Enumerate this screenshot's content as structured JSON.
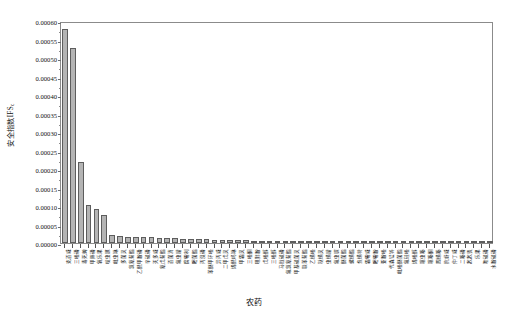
{
  "chart_data": {
    "type": "bar",
    "title": "",
    "subtitle": "",
    "xlabel": "农药",
    "ylabel": "安全指数IFS",
    "ylabel_sub": "c",
    "ylim": [
      0.0,
      0.0006
    ],
    "ytick_step": 5e-05,
    "grid": false,
    "legend": null,
    "bar_color": "#b4b4b4",
    "bar_edge_color": "#5d5d5d",
    "frame_color": "#8b8b8b",
    "ytick_labels": [
      "0.00000",
      "0.00005",
      "0.00010",
      "0.00015",
      "0.00020",
      "0.00025",
      "0.00030",
      "0.00035",
      "0.00040",
      "0.00045",
      "0.00050",
      "0.00055",
      "0.00060"
    ],
    "ytick_values": [
      0.0,
      5e-05,
      0.0001,
      0.00015,
      0.0002,
      0.00025,
      0.0003,
      0.00035,
      0.0004,
      0.00045,
      0.0005,
      0.00055,
      0.0006
    ],
    "categories": [
      "克百威",
      "三唑磷",
      "毒死蜱",
      "甲拌磷",
      "氧乐果",
      "啶虫脒",
      "吡虫啉",
      "多菌灵",
      "氯氰菊酯",
      "乙酰甲胺磷",
      "辛硫磷",
      "灭多威",
      "氰戊菊酯",
      "百菌清",
      "氟虫腈",
      "腐霉利",
      "嘧菌酯",
      "丙溴磷",
      "苯醚甲环唑",
      "异丙威",
      "二甲戊灵",
      "烯酰吗啉",
      "甲霜灵",
      "三唑酮",
      "咪鲜胺",
      "戊唑醇",
      "三唑醇",
      "马拉硫磷",
      "氟氯氰菊酯",
      "甲基硫菌灵",
      "联苯菊酯",
      "乙螨唑",
      "哒螨灵",
      "虫螨腈",
      "氟虫脲",
      "醚菌酯",
      "螺螨酯",
      "炔螨特",
      "霜霉威",
      "嘧霉胺",
      "亚胺唑",
      "代森锰锌",
      "吡唑醚菌酯",
      "氟硅唑",
      "烯唑醇",
      "噻虫嗪",
      "噻嗪酮",
      "四螨嗪",
      "抗蚜威",
      "仲丁威",
      "二嗪磷",
      "敌敌畏",
      "乐果",
      "喹硫磷",
      "水胺硫磷"
    ],
    "values": [
      0.000578,
      0.000527,
      0.000219,
      0.000104,
      9.3e-05,
      7.5e-05,
      2.05e-05,
      1.85e-05,
      1.75e-05,
      1.68e-05,
      1.6e-05,
      1.52e-05,
      1.45e-05,
      1.38e-05,
      1.3e-05,
      1.2e-05,
      1.12e-05,
      1.05e-05,
      9.8e-06,
      9.2e-06,
      8.6e-06,
      8e-06,
      7.5e-06,
      7e-06,
      6.6e-06,
      6.2e-06,
      5.8e-06,
      5.4e-06,
      5e-06,
      4.7e-06,
      4.4e-06,
      4.1e-06,
      3.8e-06,
      3.5e-06,
      3.3e-06,
      3e-06,
      2.8e-06,
      2.6e-06,
      2.4e-06,
      2.2e-06,
      2e-06,
      1.8e-06,
      1.7e-06,
      1.5e-06,
      1.4e-06,
      1.3e-06,
      1.1e-06,
      1e-06,
      9e-07,
      8e-07,
      7e-07,
      6e-07,
      5e-07,
      4e-07,
      3e-07
    ]
  }
}
